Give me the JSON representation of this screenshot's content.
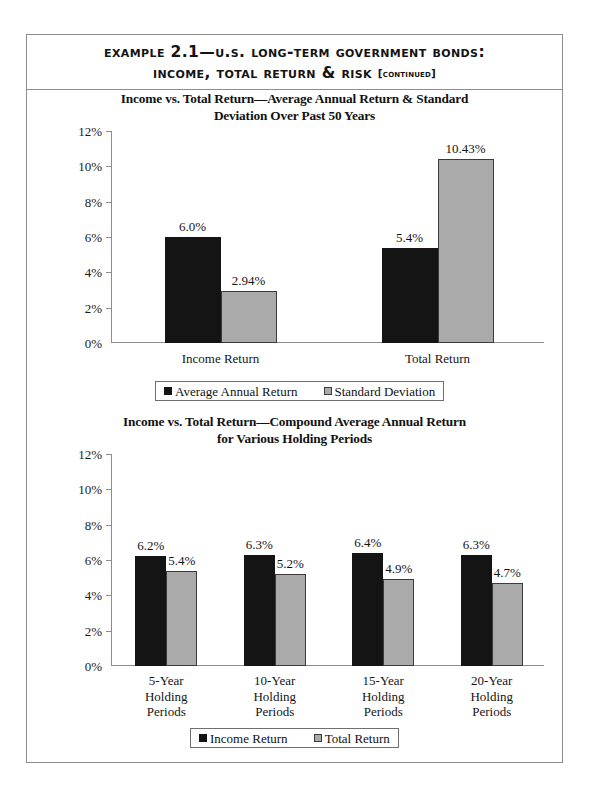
{
  "header": {
    "line1_before": "Example ",
    "line1_num": "2.1",
    "line1_after": "—U.S. Long-Term Government Bonds:",
    "line2": "Income, Total Return & Risk ",
    "continued": "[continued]"
  },
  "chart_data": [
    {
      "id": "chart-one",
      "type": "bar",
      "title": "Income vs. Total Return—Average Annual Return & Standard Deviation Over Past 50 Years",
      "title_line1": "Income vs. Total Return—Average Annual Return & Standard",
      "title_line2": "Deviation Over Past 50 Years",
      "categories": [
        "Income Return",
        "Total Return"
      ],
      "series": [
        {
          "name": "Average Annual Return",
          "color": "#141414",
          "values": [
            6.0,
            5.4
          ],
          "labels": [
            "6.0%",
            "5.4%"
          ]
        },
        {
          "name": "Standard Deviation",
          "color": "#aaaaaa",
          "values": [
            2.94,
            10.43
          ],
          "labels": [
            "2.94%",
            "10.43%"
          ]
        }
      ],
      "ylim": [
        0,
        12
      ],
      "yticks": [
        0,
        2,
        4,
        6,
        8,
        10,
        12
      ],
      "ytick_labels": [
        "0%",
        "2%",
        "4%",
        "6%",
        "8%",
        "10%",
        "12%"
      ],
      "xlabel": "",
      "ylabel": "",
      "grid": false,
      "legend_position": "bottom"
    },
    {
      "id": "chart-two",
      "type": "bar",
      "title": "Income vs. Total Return—Compound Average Annual Return for Various Holding Periods",
      "title_line1": "Income vs. Total Return—Compound Average Annual Return",
      "title_line2": "for Various Holding Periods",
      "categories": [
        "5-Year\nHolding\nPeriods",
        "10-Year\nHolding\nPeriods",
        "15-Year\nHolding\nPeriods",
        "20-Year\nHolding\nPeriods"
      ],
      "category_lines": [
        [
          "5-Year",
          "Holding",
          "Periods"
        ],
        [
          "10-Year",
          "Holding",
          "Periods"
        ],
        [
          "15-Year",
          "Holding",
          "Periods"
        ],
        [
          "20-Year",
          "Holding",
          "Periods"
        ]
      ],
      "series": [
        {
          "name": "Income Return",
          "color": "#141414",
          "values": [
            6.2,
            6.3,
            6.4,
            6.3
          ],
          "labels": [
            "6.2%",
            "6.3%",
            "6.4%",
            "6.3%"
          ]
        },
        {
          "name": "Total Return",
          "color": "#aaaaaa",
          "values": [
            5.4,
            5.2,
            4.9,
            4.7
          ],
          "labels": [
            "5.4%",
            "5.2%",
            "4.9%",
            "4.7%"
          ]
        }
      ],
      "ylim": [
        0,
        12
      ],
      "yticks": [
        0,
        2,
        4,
        6,
        8,
        10,
        12
      ],
      "ytick_labels": [
        "0%",
        "2%",
        "4%",
        "6%",
        "8%",
        "10%",
        "12%"
      ],
      "xlabel": "",
      "ylabel": "",
      "grid": false,
      "legend_position": "bottom"
    }
  ],
  "colors": {
    "series_dark": "#141414",
    "series_light": "#aaaaaa",
    "axis": "#8d8d8d",
    "frame": "#8d8d8d",
    "text": "#111111"
  }
}
